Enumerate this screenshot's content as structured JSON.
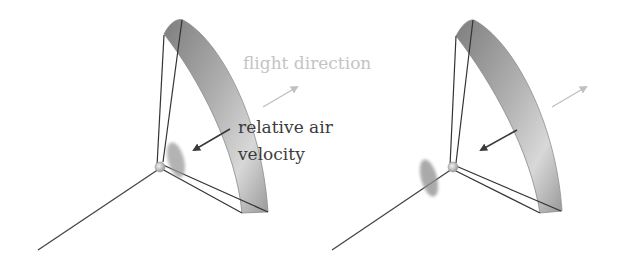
{
  "labels": {
    "flight_direction": "flight direction",
    "relative_air_line1": "relative air",
    "relative_air_line2": "velocity"
  },
  "colors": {
    "flight_arrow": "#c0c0c0",
    "air_arrow": "#3a3a3a",
    "tether": "#444444",
    "dish_dark": "#8a8a8a",
    "dish_light": "#e4e4e4"
  },
  "figures": [
    {
      "name": "kite-configuration-left",
      "rotor_position": "behind-hub"
    },
    {
      "name": "kite-configuration-right",
      "rotor_position": "front-of-hub"
    }
  ]
}
